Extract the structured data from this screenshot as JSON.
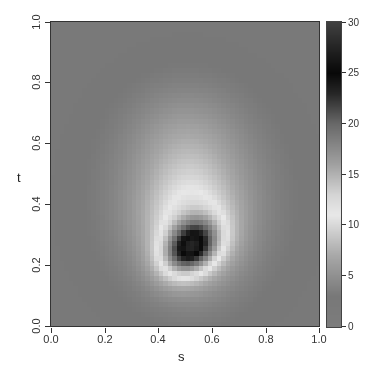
{
  "chart_data": {
    "type": "heatmap",
    "title": "",
    "xlabel": "s",
    "ylabel": "t",
    "xlim": [
      0.0,
      1.0
    ],
    "ylim": [
      0.0,
      1.0
    ],
    "x_ticks": [
      "0.0",
      "0.2",
      "0.4",
      "0.6",
      "0.8",
      "1.0"
    ],
    "y_ticks": [
      "0.0",
      "0.2",
      "0.4",
      "0.6",
      "0.8",
      "1.0"
    ],
    "grid": false,
    "colorbar": {
      "position": "right",
      "range": [
        0,
        30
      ],
      "ticks": [
        "0",
        "5",
        "10",
        "15",
        "20",
        "25",
        "30"
      ],
      "colormap": [
        {
          "value": 0,
          "color": "#7c7c7c"
        },
        {
          "value": 3,
          "color": "#787878"
        },
        {
          "value": 7,
          "color": "#a8a8a8"
        },
        {
          "value": 11,
          "color": "#e8e8e8"
        },
        {
          "value": 13,
          "color": "#d4d4d4"
        },
        {
          "value": 16,
          "color": "#a0a0a0"
        },
        {
          "value": 20,
          "color": "#686868"
        },
        {
          "value": 23,
          "color": "#262626"
        },
        {
          "value": 25,
          "color": "#080808"
        },
        {
          "value": 27,
          "color": "#1e1e1e"
        },
        {
          "value": 30,
          "color": "#404040"
        }
      ]
    },
    "grid_resolution": [
      60,
      60
    ],
    "background_value": 2.5,
    "features": [
      {
        "name": "outer-halo",
        "s_center": 0.52,
        "t_center": 0.42,
        "s_sigma": 0.2,
        "t_sigma": 0.2,
        "peak": 3.5
      },
      {
        "name": "upper-plume",
        "s_center": 0.5,
        "t_center": 0.62,
        "s_sigma": 0.14,
        "t_sigma": 0.12,
        "peak": 2.0
      },
      {
        "name": "bright-ring",
        "s_center": 0.52,
        "t_center": 0.33,
        "s_sigma": 0.12,
        "t_sigma": 0.13,
        "peak": 6.5
      },
      {
        "name": "dark-core",
        "s_center": 0.52,
        "t_center": 0.26,
        "s_sigma": 0.075,
        "t_sigma": 0.055,
        "peak": 17.0,
        "tilt_deg": 30
      }
    ],
    "peak_value_approx": 26,
    "peak_location": {
      "s": 0.5,
      "t": 0.25
    }
  }
}
